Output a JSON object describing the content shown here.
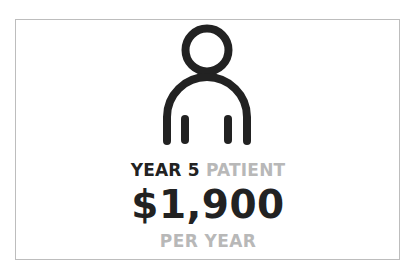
{
  "card": {
    "icon": "person-icon",
    "label": {
      "primary": "YEAR 5",
      "secondary": "PATIENT"
    },
    "amount": "$1,900",
    "period": "PER YEAR"
  },
  "colors": {
    "dark": "#222222",
    "grey": "#b8b8b8",
    "border": "#bdbdbd"
  }
}
